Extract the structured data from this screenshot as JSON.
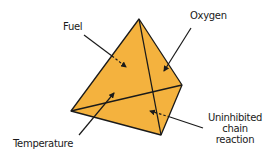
{
  "diagram": {
    "fill_color": "#F4B23E",
    "stroke_color": "#1a1a1a",
    "labels": {
      "fuel": "Fuel",
      "oxygen": "Oxygen",
      "temperature": "Temperature",
      "chain_line1": "Uninhibited",
      "chain_line2": "chain",
      "chain_line3": "reaction"
    },
    "vertices": {
      "apex": [
        139,
        19
      ],
      "left": [
        71,
        111
      ],
      "right": [
        182,
        85
      ],
      "bottom": [
        161,
        135
      ]
    }
  }
}
